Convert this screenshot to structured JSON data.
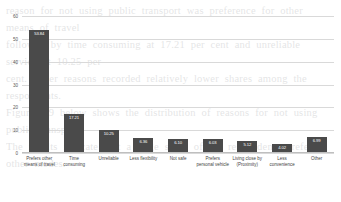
{
  "background_text": {
    "lines": [
      "reason for not using public transport was preference for other means of travel",
      "followed by time consuming at 17.21 per cent and unreliable service at 10.25 per",
      "cent. Other reasons recorded relatively lower shares among the respondents.",
      "Figure 4.9 below shows the distribution of reasons for not using public transport.",
      "The results indicate that a large share of the respondents prefer other modes."
    ]
  },
  "chart_data": {
    "type": "bar",
    "title": "",
    "xlabel": "",
    "ylabel": "",
    "ylim": [
      0,
      60
    ],
    "yticks": [
      "60",
      "50",
      "40",
      "30",
      "20",
      "10",
      "0"
    ],
    "grid": true,
    "legend": "none",
    "bar_color": "#4a4a4a",
    "label_color": "#ffffff",
    "categories": [
      "Prefers other means of travel",
      "Time consuming",
      "Unreliable",
      "Less flexibility",
      "Not safe",
      "Prefers personal vehicle",
      "Living close by (Proximity)",
      "Less convenience",
      "Other"
    ],
    "values": [
      53.84,
      17.21,
      10.25,
      6.36,
      6.1,
      6.03,
      5.12,
      4.02,
      6.99
    ],
    "value_labels": [
      "53.84",
      "17.21",
      "10.25",
      "6.36",
      "6.10",
      "6.03",
      "5.12",
      "4.02",
      "6.99"
    ]
  }
}
